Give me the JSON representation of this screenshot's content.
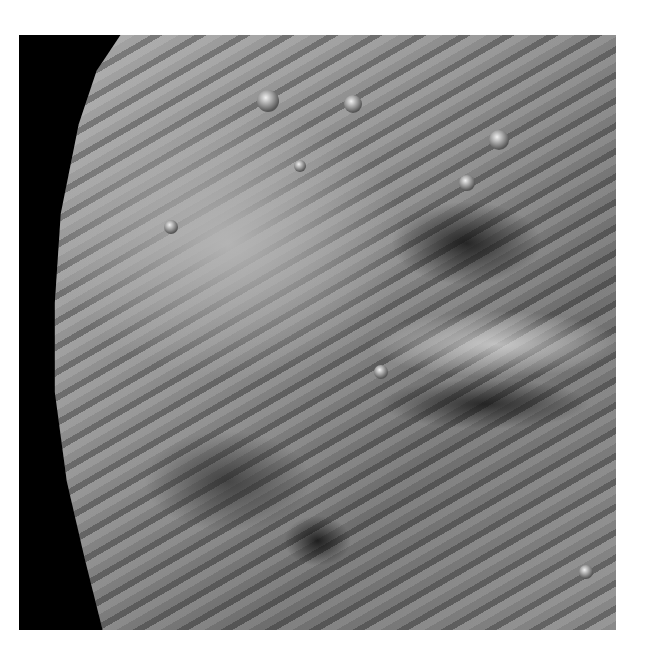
{
  "image": {
    "description": "Grayscale spacecraft photograph of a cratered, grooved moon surface against black space",
    "colors": {
      "background": "#ffffff",
      "space": "#000000",
      "surface_mid": "#8c8c8c"
    }
  }
}
